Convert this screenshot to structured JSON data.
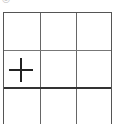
{
  "header": {
    "partial_text": "◎ ◦ ◦"
  },
  "grid": {
    "rows": 3,
    "cols": 3,
    "cells": [
      {
        "row": 0,
        "col": 0,
        "content": ""
      },
      {
        "row": 0,
        "col": 1,
        "content": ""
      },
      {
        "row": 0,
        "col": 2,
        "content": ""
      },
      {
        "row": 1,
        "col": 0,
        "content": "plus-icon"
      },
      {
        "row": 1,
        "col": 1,
        "content": ""
      },
      {
        "row": 1,
        "col": 2,
        "content": ""
      },
      {
        "row": 2,
        "col": 0,
        "content": ""
      },
      {
        "row": 2,
        "col": 1,
        "content": ""
      },
      {
        "row": 2,
        "col": 2,
        "content": ""
      }
    ]
  }
}
